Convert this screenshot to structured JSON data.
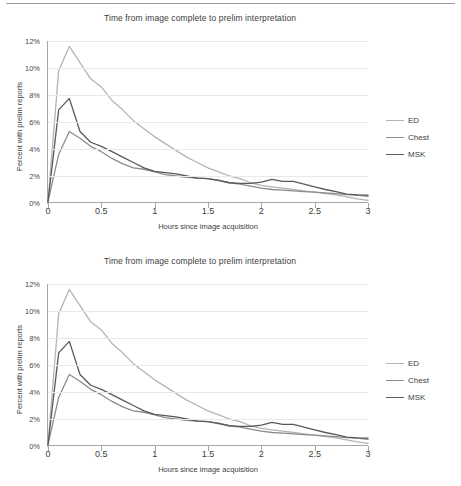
{
  "figure_count": 2,
  "colors": {
    "ed": "#b4b4b4",
    "chest": "#8c8c8c",
    "msk": "#595959",
    "axis": "#a6a6a6",
    "grid": "#e9e9e9",
    "text": "#3d3d3d",
    "rule": "#9a9a9a"
  },
  "legend": {
    "items": [
      {
        "label": "ED",
        "color": "#b4b4b4"
      },
      {
        "label": "Chest",
        "color": "#8c8c8c"
      },
      {
        "label": "MSK",
        "color": "#595959"
      }
    ]
  },
  "chart_data": {
    "type": "line",
    "title": "Time from image complete to prelim interpretation",
    "xlabel": "Hours since image acquisition",
    "ylabel": "Percent with prelim reports",
    "xlim": [
      0,
      3
    ],
    "ylim": [
      0,
      12
    ],
    "xticks": [
      0,
      0.5,
      1,
      1.5,
      2,
      2.5,
      3
    ],
    "xticklabels": [
      "0",
      "0.5",
      "1",
      "1.5",
      "2",
      "2.5",
      "3"
    ],
    "yticks": [
      0,
      2,
      4,
      6,
      8,
      10,
      12
    ],
    "yticklabels": [
      "0%",
      "2%",
      "4%",
      "6%",
      "8%",
      "10%",
      "12%"
    ],
    "grid": "horizontal",
    "legend_position": "right",
    "x": [
      0,
      0.1,
      0.2,
      0.3,
      0.4,
      0.5,
      0.6,
      0.7,
      0.8,
      0.9,
      1.0,
      1.1,
      1.2,
      1.3,
      1.4,
      1.5,
      1.6,
      1.7,
      1.8,
      1.9,
      2.0,
      2.1,
      2.2,
      2.3,
      2.4,
      2.5,
      2.6,
      2.7,
      2.8,
      2.9,
      3.0
    ],
    "series": [
      {
        "name": "ED",
        "color": "#b4b4b4",
        "values": [
          0.1,
          9.8,
          11.6,
          10.4,
          9.2,
          8.6,
          7.6,
          6.9,
          6.1,
          5.5,
          4.9,
          4.4,
          3.9,
          3.4,
          3.0,
          2.6,
          2.3,
          2.0,
          1.8,
          1.5,
          1.3,
          1.2,
          1.1,
          1.0,
          0.9,
          0.8,
          0.7,
          0.6,
          0.45,
          0.3,
          0.2
        ]
      },
      {
        "name": "Chest",
        "color": "#8c8c8c",
        "values": [
          0.1,
          3.6,
          5.3,
          4.8,
          4.2,
          3.8,
          3.3,
          2.9,
          2.6,
          2.5,
          2.3,
          2.1,
          2.0,
          1.9,
          1.85,
          1.8,
          1.7,
          1.5,
          1.4,
          1.25,
          1.1,
          1.0,
          0.95,
          0.9,
          0.85,
          0.8,
          0.75,
          0.7,
          0.62,
          0.58,
          0.5
        ]
      },
      {
        "name": "MSK",
        "color": "#595959",
        "values": [
          0.1,
          6.9,
          7.75,
          5.3,
          4.5,
          4.2,
          3.8,
          3.4,
          3.0,
          2.6,
          2.35,
          2.25,
          2.15,
          2.0,
          1.85,
          1.8,
          1.65,
          1.5,
          1.45,
          1.45,
          1.55,
          1.75,
          1.6,
          1.6,
          1.4,
          1.2,
          1.0,
          0.85,
          0.65,
          0.6,
          0.58
        ]
      }
    ]
  }
}
